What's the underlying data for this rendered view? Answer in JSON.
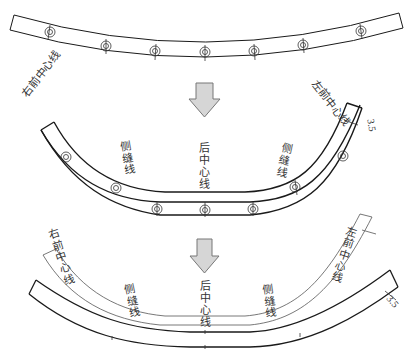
{
  "figure": {
    "colors": {
      "line": "#1a1a1a",
      "thin_line": "#555555",
      "arrow_fill": "#d6d6d6",
      "arrow_stroke": "#777777"
    }
  },
  "step1": {
    "notch_count": 7
  },
  "step2": {
    "labels": {
      "right_front_center": "右前中心线",
      "left_front_center": "左前中心线",
      "back_center": "后中心线",
      "side_seam_left": "侧缝线",
      "side_seam_right": "侧缝线",
      "dimension": "3.5"
    },
    "notch_count": 7
  },
  "step3": {
    "labels": {
      "right_front_center": "右前中心线",
      "left_front_center": "左前中心线",
      "back_center": "后中心线",
      "side_seam_left": "侧缝线",
      "side_seam_right": "侧缝线",
      "dimension": "3.5"
    }
  },
  "arrows": [
    {
      "direction": "down",
      "position": "between-step1-step2"
    },
    {
      "direction": "down",
      "position": "between-step2-step3"
    }
  ]
}
